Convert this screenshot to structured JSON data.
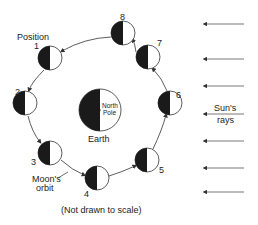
{
  "labels": {
    "position": "Position",
    "earth": "Earth",
    "north_pole_line1": "North",
    "north_pole_line2": "Pole",
    "suns_rays_line1": "Sun's",
    "suns_rays_line2": "rays",
    "moons_orbit_line1": "Moon's",
    "moons_orbit_line2": "orbit",
    "scale_note": "(Not drawn to scale)"
  },
  "moons": [
    {
      "position": "1",
      "cx": 50,
      "cy": 58
    },
    {
      "position": "2",
      "cx": 25,
      "cy": 103
    },
    {
      "position": "3",
      "cx": 50,
      "cy": 153
    },
    {
      "position": "4",
      "cx": 97,
      "cy": 178
    },
    {
      "position": "5",
      "cx": 147,
      "cy": 160
    },
    {
      "position": "6",
      "cx": 170,
      "cy": 103
    },
    {
      "position": "7",
      "cx": 148,
      "cy": 57
    },
    {
      "position": "8",
      "cx": 123,
      "cy": 33
    }
  ],
  "sun_ray_count": 7,
  "colors": {
    "dark_side": "#1a1a1a",
    "lit_side": "#ffffff",
    "line": "#333333",
    "ray": "#555555"
  }
}
